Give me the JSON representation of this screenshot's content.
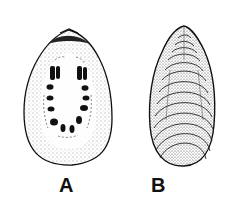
{
  "figure": {
    "panels": [
      {
        "label": "A",
        "view": "interior"
      },
      {
        "label": "B",
        "view": "exterior"
      }
    ],
    "colors": {
      "ink": "#111111",
      "background": "#ffffff"
    }
  }
}
